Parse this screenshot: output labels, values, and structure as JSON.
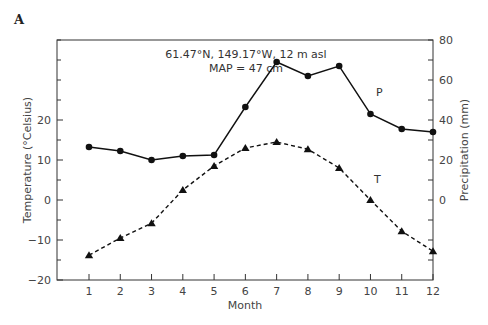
{
  "panel_label": "A",
  "annotation": {
    "line1": "61.47°N, 149.17°W, 12 m asl",
    "line2": "MAP = 47 cm"
  },
  "chart_data": {
    "type": "line",
    "title": "",
    "xlabel": "Month",
    "ylabel_left": "Temperature (°Celsius)",
    "ylabel_right": "Precipitation (mm)",
    "x": [
      1,
      2,
      3,
      4,
      5,
      6,
      7,
      8,
      9,
      10,
      11,
      12
    ],
    "categories": [
      "1",
      "2",
      "3",
      "4",
      "5",
      "6",
      "7",
      "8",
      "9",
      "10",
      "11",
      "12"
    ],
    "ylim_left": [
      -20,
      40
    ],
    "yticks_left": [
      -20,
      -10,
      0,
      10,
      20
    ],
    "ylim_right": [
      -40,
      80
    ],
    "yticks_right": [
      0,
      20,
      40,
      60,
      80
    ],
    "grid": false,
    "series": [
      {
        "name": "P",
        "label": "P",
        "axis": "right",
        "unit": "mm",
        "style": "solid",
        "marker": "circle",
        "values": [
          26.5,
          24.5,
          20,
          22,
          22.5,
          46.5,
          69,
          62,
          67,
          43,
          35.5,
          34
        ]
      },
      {
        "name": "T",
        "label": "T",
        "axis": "left",
        "unit": "°C",
        "style": "dashed",
        "marker": "triangle",
        "values": [
          -13.8,
          -9.5,
          -5.8,
          2.5,
          8.5,
          13,
          14.5,
          12.7,
          8,
          0,
          -7.8,
          -12.8
        ]
      }
    ],
    "annotations": [
      "61.47°N, 149.17°W, 12 m asl",
      "MAP = 47 cm"
    ]
  }
}
